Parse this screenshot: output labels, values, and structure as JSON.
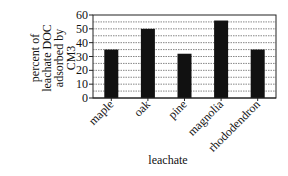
{
  "chart_data": {
    "type": "bar",
    "title": "",
    "xlabel": "leachate",
    "ylabel": "percent of leachate DOC adsorbed by CM3",
    "ylabel_lines": [
      "percent of",
      "leachate DOC",
      "adsorbed by",
      "CM3"
    ],
    "categories": [
      "maple",
      "oak",
      "pine",
      "magnolia",
      "rhododendron"
    ],
    "values": [
      35,
      50,
      32,
      56,
      35
    ],
    "ylim": [
      0,
      60
    ],
    "yticks": [
      0,
      10,
      20,
      30,
      40,
      50,
      60
    ],
    "grid": true,
    "grid_step": 5,
    "grid_style": "dotted",
    "bar_color": "#111111",
    "legend": null
  }
}
